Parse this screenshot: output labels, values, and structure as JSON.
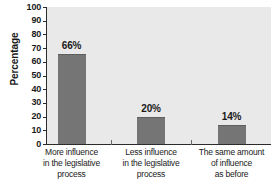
{
  "chart_data": {
    "type": "bar",
    "title": "",
    "xlabel": "",
    "ylabel": "Percentage",
    "ylim": [
      0,
      100
    ],
    "ytick_step": 10,
    "yticks": [
      100,
      90,
      80,
      70,
      60,
      50,
      40,
      30,
      20,
      10,
      0
    ],
    "ytick_labels": [
      "100",
      "90",
      "80",
      "70",
      "60",
      "50",
      "40",
      "30",
      "20",
      "10",
      "0"
    ],
    "grid": false,
    "legend": null,
    "categories": [
      "More influence in the legislative process",
      "Less influence in the legislative process",
      "The same amount of influence as before"
    ],
    "category_lines": [
      [
        "More influence",
        "in the legislative",
        "process"
      ],
      [
        "Less influence",
        "in the legislative",
        "process"
      ],
      [
        "The same amount",
        "of influence",
        "as before"
      ]
    ],
    "values": [
      66,
      20,
      14
    ],
    "data_labels": [
      "66%",
      "20%",
      "14%"
    ],
    "colors": {
      "bar_fill": "#757575",
      "bar_edge": "#5f5f5f",
      "plot_background": "#e9e9e9",
      "figure_background": "#ffffff",
      "axis": "#2b2b2b",
      "text": "#1a1a1a"
    }
  }
}
